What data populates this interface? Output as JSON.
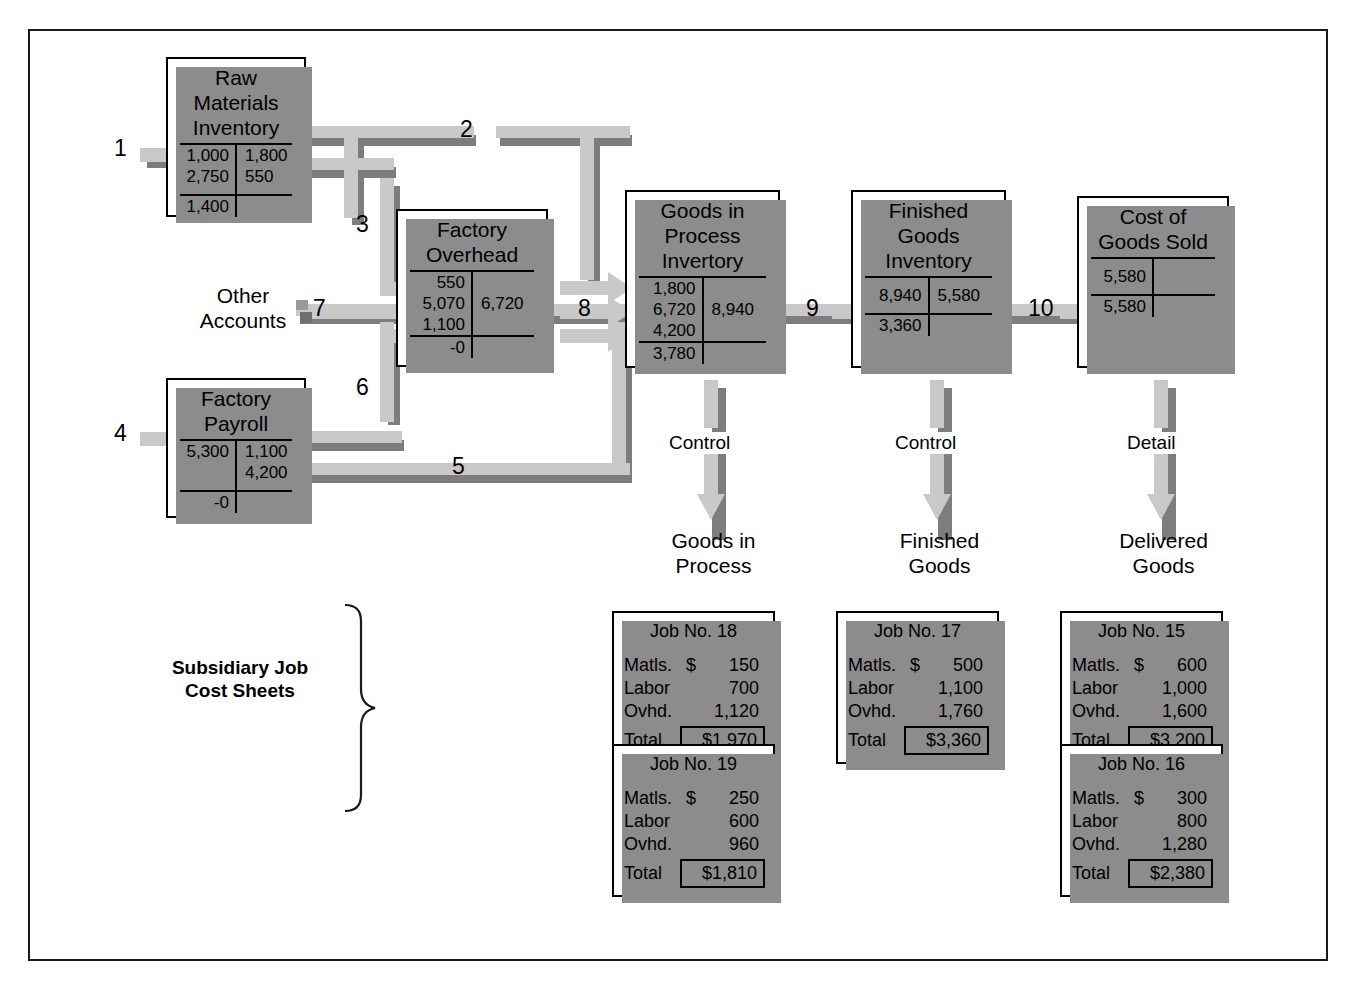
{
  "diagram": {
    "colors": {
      "arrow_light": "#c9c9c9",
      "arrow_shadow": "#7d7d7d",
      "box_shadow": "#8c8c8c",
      "line": "#000000"
    }
  },
  "accounts": [
    {
      "id": "raw-materials-inventory",
      "title": "Raw Materials\nInventory",
      "rows": [
        {
          "debit": "1,000",
          "credit": "1,800"
        },
        {
          "debit": "2,750",
          "credit": "550"
        }
      ],
      "balance": {
        "debit": "1,400",
        "credit": ""
      }
    },
    {
      "id": "factory-overhead",
      "title": "Factory\nOverhead",
      "rows": [
        {
          "debit": "550",
          "credit": ""
        },
        {
          "debit": "5,070",
          "credit": "6,720"
        },
        {
          "debit": "1,100",
          "credit": ""
        }
      ],
      "balance": {
        "debit": "-0",
        "credit": ""
      }
    },
    {
      "id": "goods-in-process-inventory",
      "title": "Goods in\nProcess\nInvertory",
      "rows": [
        {
          "debit": "1,800",
          "credit": ""
        },
        {
          "debit": "6,720",
          "credit": "8,940"
        },
        {
          "debit": "4,200",
          "credit": ""
        }
      ],
      "balance": {
        "debit": "3,780",
        "credit": ""
      }
    },
    {
      "id": "finished-goods-inventory",
      "title": "Finished\nGoods\nInventory",
      "rows": [
        {
          "debit": "8,940",
          "credit": "5,580"
        }
      ],
      "balance": {
        "debit": "3,360",
        "credit": ""
      }
    },
    {
      "id": "cost-of-goods-sold",
      "title": "Cost of\nGoods Sold",
      "rows": [
        {
          "debit": "5,580",
          "credit": ""
        }
      ],
      "balance": {
        "debit": "5,580",
        "credit": ""
      }
    },
    {
      "id": "factory-payroll",
      "title": "Factory\nPayroll",
      "rows": [
        {
          "debit": "5,300",
          "credit": "1,100"
        },
        {
          "debit": "",
          "credit": "4,200"
        }
      ],
      "balance": {
        "debit": "-0",
        "credit": ""
      }
    }
  ],
  "other_accounts_label": "Other\nAccounts",
  "flow_numbers": [
    "1",
    "2",
    "3",
    "4",
    "5",
    "6",
    "7",
    "8",
    "9",
    "10"
  ],
  "control_arrows": [
    {
      "id": "gip",
      "label": "Control",
      "target": "Goods in\nProcess"
    },
    {
      "id": "fg",
      "label": "Control",
      "target": "Finished\nGoods"
    },
    {
      "id": "dg",
      "label": "Detail",
      "target": "Delivered\nGoods"
    }
  ],
  "subsidiary_label": "Subsidiary Job\nCost Sheets",
  "job_sheets": [
    {
      "id": "job-18",
      "title": "Job No. 18",
      "lines": [
        {
          "label": "Matls.",
          "currency": "$",
          "value": "150"
        },
        {
          "label": "Labor",
          "currency": "",
          "value": "700"
        },
        {
          "label": "Ovhd.",
          "currency": "",
          "value": "1,120"
        }
      ],
      "total_label": "Total",
      "total": "$1,970"
    },
    {
      "id": "job-19",
      "title": "Job No. 19",
      "lines": [
        {
          "label": "Matls.",
          "currency": "$",
          "value": "250"
        },
        {
          "label": "Labor",
          "currency": "",
          "value": "600"
        },
        {
          "label": "Ovhd.",
          "currency": "",
          "value": "960"
        }
      ],
      "total_label": "Total",
      "total": "$1,810"
    },
    {
      "id": "job-17",
      "title": "Job No. 17",
      "lines": [
        {
          "label": "Matls.",
          "currency": "$",
          "value": "500"
        },
        {
          "label": "Labor",
          "currency": "",
          "value": "1,100"
        },
        {
          "label": "Ovhd.",
          "currency": "",
          "value": "1,760"
        }
      ],
      "total_label": "Total",
      "total": "$3,360"
    },
    {
      "id": "job-15",
      "title": "Job No. 15",
      "lines": [
        {
          "label": "Matls.",
          "currency": "$",
          "value": "600"
        },
        {
          "label": "Labor",
          "currency": "",
          "value": "1,000"
        },
        {
          "label": "Ovhd.",
          "currency": "",
          "value": "1,600"
        }
      ],
      "total_label": "Total",
      "total": "$3,200"
    },
    {
      "id": "job-16",
      "title": "Job No. 16",
      "lines": [
        {
          "label": "Matls.",
          "currency": "$",
          "value": "300"
        },
        {
          "label": "Labor",
          "currency": "",
          "value": "800"
        },
        {
          "label": "Ovhd.",
          "currency": "",
          "value": "1,280"
        }
      ],
      "total_label": "Total",
      "total": "$2,380"
    }
  ]
}
